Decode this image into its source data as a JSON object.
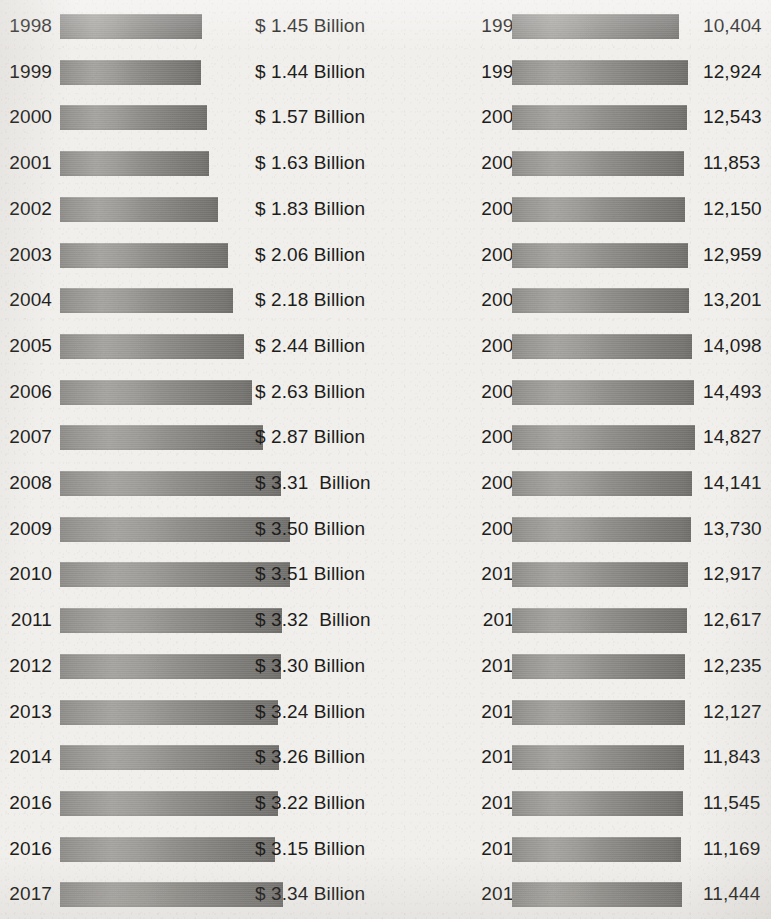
{
  "chart_data": [
    {
      "type": "bar",
      "title": "",
      "xlabel": "",
      "ylabel": "",
      "orientation": "horizontal",
      "grid": false,
      "legend": "none",
      "value_format": "$ {v} Billion",
      "xlim": [
        0,
        3.51
      ],
      "categories": [
        "1998",
        "1999",
        "2000",
        "2001",
        "2002",
        "2003",
        "2004",
        "2005",
        "2006",
        "2007",
        "2008",
        "2009",
        "2010",
        "2011",
        "2012",
        "2013",
        "2014",
        "2016",
        "2016",
        "2017"
      ],
      "values": [
        1.45,
        1.44,
        1.57,
        1.63,
        1.83,
        2.06,
        2.18,
        2.44,
        2.63,
        2.87,
        3.31,
        3.5,
        3.51,
        3.32,
        3.3,
        3.24,
        3.26,
        3.22,
        3.15,
        3.34
      ],
      "value_labels": [
        "$ 1.45 Billion",
        "$ 1.44 Billion",
        "$ 1.57 Billion",
        "$ 1.63 Billion",
        "$ 1.83 Billion",
        "$ 2.06 Billion",
        "$ 2.18 Billion",
        "$ 2.44 Billion",
        "$ 2.63 Billion",
        "$ 2.87 Billion",
        "$ 3.31  Billion",
        "$ 3.50 Billion",
        "$ 3.51 Billion",
        "$ 3.32  Billion",
        "$ 3.30 Billion",
        "$ 3.24 Billion",
        "$ 3.26 Billion",
        "$ 3.22 Billion",
        "$ 3.15 Billion",
        "$ 3.34 Billion"
      ]
    },
    {
      "type": "bar",
      "title": "",
      "xlabel": "",
      "ylabel": "",
      "orientation": "horizontal",
      "grid": false,
      "legend": "none",
      "value_format": "{v}",
      "xlim": [
        0,
        14827
      ],
      "categories": [
        "1998",
        "1999",
        "2000",
        "2001",
        "2002",
        "2003",
        "2004",
        "2005",
        "2006",
        "2007",
        "2008",
        "2009",
        "2010",
        "2011",
        "2012",
        "2013",
        "2014",
        "2016",
        "2016",
        "2017"
      ],
      "values": [
        10404,
        12924,
        12543,
        11853,
        12150,
        12959,
        13201,
        14098,
        14493,
        14827,
        14141,
        13730,
        12917,
        12617,
        12235,
        12127,
        11843,
        11545,
        11169,
        11444
      ],
      "value_labels": [
        "10,404",
        "12,924",
        "12,543",
        "11,853",
        "12,150",
        "12,959",
        "13,201",
        "14,098",
        "14,493",
        "14,827",
        "14,141",
        "13,730",
        "12,917",
        "12,617",
        "12,235",
        "12,127",
        "11,843",
        "11,545",
        "11,169",
        "11,444"
      ]
    }
  ],
  "style": {
    "background": "#f1efec",
    "text_color": "#1d1d1b",
    "bar_light": "#a5a39f",
    "bar_mid": "#8e8c89",
    "bar_dark": "#6f6d6a"
  }
}
